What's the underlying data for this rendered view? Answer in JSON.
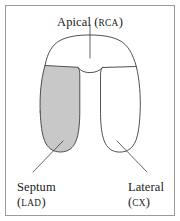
{
  "figure": {
    "background_color": "#ffffff",
    "frame_color": "#9a9a9a",
    "outline_color": "#3d3d3d",
    "shaded_fill_color": "#c8c8c8",
    "unshaded_fill_color": "#ffffff"
  },
  "labels": {
    "apical": {
      "name": "Apical",
      "artery_open": "(",
      "artery": "RCA",
      "artery_close": ")"
    },
    "septum": {
      "name": "Septum",
      "artery_open": "(",
      "artery": "LAD",
      "artery_close": ")"
    },
    "lateral": {
      "name": "Lateral",
      "artery_open": "(",
      "artery": "CX",
      "artery_close": ")"
    }
  },
  "segments": [
    {
      "id": "apical",
      "label": "Apical",
      "artery": "RCA",
      "shaded": false,
      "position": "top"
    },
    {
      "id": "septum",
      "label": "Septum",
      "artery": "LAD",
      "shaded": true,
      "position": "left"
    },
    {
      "id": "lateral",
      "label": "Lateral",
      "artery": "CX",
      "shaded": false,
      "position": "right"
    }
  ]
}
